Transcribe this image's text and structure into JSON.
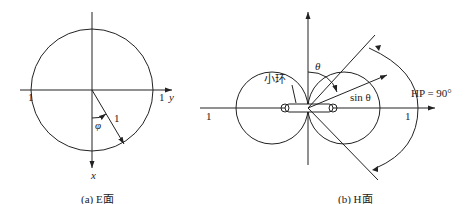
{
  "panel_a": {
    "caption": "(a) E面",
    "axis_y_label": "y",
    "axis_x_label": "x",
    "left_tick": "1",
    "right_tick": "1",
    "angle_label": "φ",
    "radius_label": "1"
  },
  "panel_b": {
    "caption": "(b) H面",
    "loop_label": "小环",
    "theta_label": "θ",
    "sin_label": "sin θ",
    "hp_label": "HP = 90°",
    "left_tick": "1",
    "right_tick": "1"
  },
  "colors": {
    "stroke": "#222222",
    "background": "#ffffff"
  }
}
